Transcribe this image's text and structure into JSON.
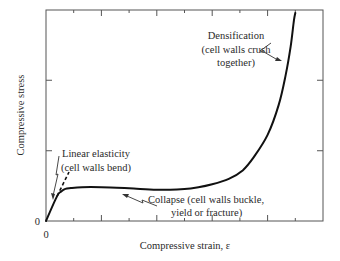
{
  "chart_data": {
    "type": "line",
    "title": "",
    "xlabel": "Compressive strain, ε",
    "ylabel": "Compressive stress",
    "x_tick_labels": [
      "0"
    ],
    "y_tick_labels": [
      "0"
    ],
    "xlim": [
      0,
      1
    ],
    "ylim": [
      0,
      1
    ],
    "grid": false,
    "x_ticks": [
      0,
      0.1,
      0.2,
      0.3,
      0.4,
      0.5,
      0.6,
      0.7,
      0.8,
      0.9,
      1.0
    ],
    "y_ticks": [
      0,
      0.333,
      0.667,
      1.0
    ],
    "series": [
      {
        "name": "stress-strain curve",
        "style": "solid",
        "points": [
          [
            0.0,
            0.0
          ],
          [
            0.04,
            0.118
          ],
          [
            0.055,
            0.14
          ],
          [
            0.07,
            0.152
          ],
          [
            0.09,
            0.156
          ],
          [
            0.13,
            0.16
          ],
          [
            0.2,
            0.16
          ],
          [
            0.3,
            0.155
          ],
          [
            0.4,
            0.148
          ],
          [
            0.5,
            0.152
          ],
          [
            0.55,
            0.16
          ],
          [
            0.6,
            0.174
          ],
          [
            0.66,
            0.2
          ],
          [
            0.71,
            0.24
          ],
          [
            0.75,
            0.303
          ],
          [
            0.8,
            0.408
          ],
          [
            0.84,
            0.55
          ],
          [
            0.865,
            0.69
          ],
          [
            0.883,
            0.825
          ],
          [
            0.895,
            0.95
          ],
          [
            0.9,
            0.986
          ]
        ]
      },
      {
        "name": "linear elastic extension",
        "style": "dashed",
        "points": [
          [
            0.04,
            0.118
          ],
          [
            0.083,
            0.232
          ]
        ]
      }
    ],
    "annotations": [
      {
        "id": "linear",
        "lines": [
          "Linear elasticity",
          "(cell walls bend)"
        ],
        "arrow_to": [
          0.04,
          0.11
        ]
      },
      {
        "id": "collapse",
        "lines": [
          "Collapse (cell walls buckle,",
          "yield or fracture)"
        ],
        "arrow_to": [
          0.3,
          0.145
        ]
      },
      {
        "id": "densification",
        "lines": [
          "Densification",
          "(cell walls crush",
          "together)"
        ],
        "arrow_to": [
          0.89,
          0.73
        ]
      }
    ]
  }
}
